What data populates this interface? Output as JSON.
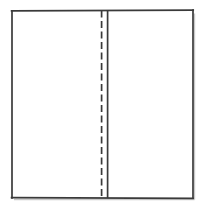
{
  "figure": {
    "background_color": "#ffffff",
    "stroke_color": "#3a3a3a",
    "shadow_color": "#c9c9c9",
    "outline": {
      "name": "outer-rectangle",
      "x": 11.5,
      "y": 10.5,
      "width": 181.5,
      "height": 187.5,
      "stroke_width": 1.6
    },
    "solid_divider": {
      "name": "panel-divider",
      "x": 107.5,
      "y_top": 10.5,
      "y_bottom": 198,
      "stroke_width": 1.6,
      "style": "solid"
    },
    "dashed_divider": {
      "name": "fold-crease",
      "x": 101.5,
      "y_top": 10.5,
      "y_bottom": 198,
      "stroke_width": 1.6,
      "style": "dashed",
      "dash_length": 7,
      "gap_length": 3.5
    },
    "panels": [
      {
        "name": "left-panel",
        "x": 11.5,
        "width": 90,
        "label": ""
      },
      {
        "name": "right-panel",
        "x": 107.5,
        "width": 85.5,
        "label": ""
      }
    ],
    "shadow": {
      "right_edge_x": 194.5,
      "bottom_edge_y": 199.5,
      "offset": 1.5,
      "stroke_width": 1.4
    }
  }
}
